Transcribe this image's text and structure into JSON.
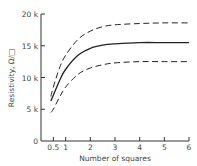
{
  "chart_data": {
    "type": "line",
    "title": "",
    "xlabel": "Number of squares",
    "ylabel": "Resistivity, Ω/□",
    "xlim": [
      0,
      6
    ],
    "ylim": [
      0,
      20000
    ],
    "x_ticks": [
      "0.5",
      "1",
      "2",
      "3",
      "4",
      "5",
      "6"
    ],
    "x_tick_values": [
      0.5,
      1,
      2,
      3,
      4,
      5,
      6
    ],
    "y_ticks": [
      "0",
      "5 k",
      "10 k",
      "15 k",
      "20 k"
    ],
    "y_tick_values": [
      0,
      5000,
      10000,
      15000,
      20000
    ],
    "grid": false,
    "legend": null,
    "x": [
      0.4,
      0.5,
      0.75,
      1,
      1.5,
      2,
      2.5,
      3,
      4,
      5,
      6
    ],
    "series": [
      {
        "name": "upper bound",
        "style": "dashed",
        "values": [
          7000,
          8500,
          11500,
          13500,
          16000,
          17300,
          18000,
          18300,
          18500,
          18600,
          18600
        ]
      },
      {
        "name": "typical",
        "style": "solid",
        "values": [
          6300,
          7200,
          9500,
          11300,
          13500,
          14600,
          15100,
          15300,
          15500,
          15500,
          15500
        ]
      },
      {
        "name": "lower bound",
        "style": "dashed",
        "values": [
          4500,
          5000,
          6900,
          8500,
          10500,
          11500,
          12000,
          12300,
          12500,
          12500,
          12500
        ]
      }
    ]
  }
}
